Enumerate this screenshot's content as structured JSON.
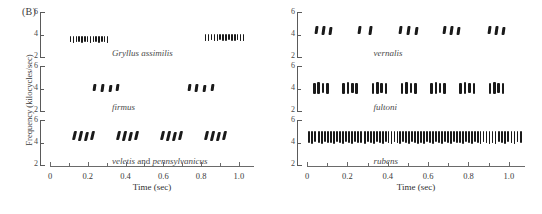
{
  "figure": {
    "panel_label": "(B)",
    "y_axis_title": "Frequency (kilocycles/sec)",
    "x_axis_title": "Time (sec)"
  },
  "axes": {
    "y_ticks": [
      "6",
      "4",
      "2"
    ],
    "y_range": [
      1.4,
      6.6
    ],
    "x_ticks_major": [
      "0",
      "0.2",
      "0.4",
      "0.6",
      "0.8",
      "1.0"
    ],
    "x_range": [
      0,
      1.08
    ],
    "x_minor_step": 0.1
  },
  "chart_data": {
    "type": "scatter",
    "title": "(B)",
    "xlabel": "Time (sec)",
    "ylabel": "Frequency (kilocycles/sec)",
    "xlim": [
      0,
      1.08
    ],
    "ylim": [
      1.4,
      6.6
    ],
    "grid": false,
    "legend": "none",
    "panels": [
      {
        "column": "left",
        "row": 0,
        "species_label": "Gryllus assimilis",
        "species_italic": "Gryllus assimilis",
        "dominant_frequency": 3.4,
        "pattern": "long chirps of many closely spaced pulses",
        "chirps": [
          {
            "start": 0.105,
            "end": 0.3,
            "pulses": 14,
            "freq": 3.4,
            "band": 0.75
          },
          {
            "start": 0.82,
            "end": 1.02,
            "pulses": 14,
            "freq": 3.6,
            "band": 0.75
          }
        ]
      },
      {
        "column": "left",
        "row": 1,
        "species_label": "firmus",
        "species_italic": "firmus",
        "dominant_frequency": 4.0,
        "pattern": "short chirps of 4 pulses",
        "chirps": [
          {
            "start": 0.23,
            "end": 0.35,
            "pulses": 4,
            "freq": 4.0,
            "band": 0.85
          },
          {
            "start": 0.73,
            "end": 0.85,
            "pulses": 4,
            "freq": 4.0,
            "band": 0.85
          }
        ]
      },
      {
        "column": "left",
        "row": 2,
        "species_label": "veletis and pennsylvanicus",
        "species_italic": "veletis",
        "species_conjunction": " and ",
        "species_italic2": "pennsylvanicus",
        "dominant_frequency": 4.7,
        "pattern": "regular chirps of 4 slanted pulses",
        "chirps": [
          {
            "start": 0.12,
            "end": 0.215,
            "pulses": 4,
            "freq": 4.7,
            "band": 1.1
          },
          {
            "start": 0.355,
            "end": 0.45,
            "pulses": 4,
            "freq": 4.7,
            "band": 1.1
          },
          {
            "start": 0.59,
            "end": 0.685,
            "pulses": 4,
            "freq": 4.7,
            "band": 1.1
          },
          {
            "start": 0.82,
            "end": 0.915,
            "pulses": 4,
            "freq": 4.7,
            "band": 1.1
          }
        ]
      },
      {
        "column": "right",
        "row": 0,
        "species_label": "vernalis",
        "species_italic": "vernalis",
        "dominant_frequency": 4.4,
        "pattern": "chirps of 2-3 pulses",
        "chirps": [
          {
            "start": 0.04,
            "end": 0.11,
            "pulses": 3,
            "freq": 4.4,
            "band": 1.0
          },
          {
            "start": 0.255,
            "end": 0.305,
            "pulses": 2,
            "freq": 4.4,
            "band": 1.0
          },
          {
            "start": 0.455,
            "end": 0.535,
            "pulses": 3,
            "freq": 4.4,
            "band": 1.0
          },
          {
            "start": 0.675,
            "end": 0.745,
            "pulses": 3,
            "freq": 4.4,
            "band": 1.0
          },
          {
            "start": 0.895,
            "end": 0.965,
            "pulses": 3,
            "freq": 4.4,
            "band": 1.0
          }
        ]
      },
      {
        "column": "right",
        "row": 1,
        "species_label": "fultoni",
        "species_italic": "fultoni",
        "dominant_frequency": 4.0,
        "pattern": "evenly spaced chirps of 3-4 pulses",
        "chirps": [
          {
            "start": 0.03,
            "end": 0.095,
            "pulses": 4,
            "freq": 4.0,
            "band": 1.3
          },
          {
            "start": 0.175,
            "end": 0.24,
            "pulses": 4,
            "freq": 4.0,
            "band": 1.3
          },
          {
            "start": 0.32,
            "end": 0.385,
            "pulses": 4,
            "freq": 4.0,
            "band": 1.3
          },
          {
            "start": 0.465,
            "end": 0.53,
            "pulses": 4,
            "freq": 4.0,
            "band": 1.3
          },
          {
            "start": 0.61,
            "end": 0.675,
            "pulses": 4,
            "freq": 4.0,
            "band": 1.3
          },
          {
            "start": 0.755,
            "end": 0.82,
            "pulses": 4,
            "freq": 4.0,
            "band": 1.3
          },
          {
            "start": 0.9,
            "end": 0.965,
            "pulses": 4,
            "freq": 4.0,
            "band": 1.3
          }
        ]
      },
      {
        "column": "right",
        "row": 2,
        "species_label": "rubens",
        "species_italic": "rubens",
        "dominant_frequency": 4.6,
        "pattern": "continuous trill of uniform pulses",
        "chirps": [
          {
            "start": 0.005,
            "end": 0.1,
            "pulses": 7,
            "freq": 4.6,
            "band": 1.4
          },
          {
            "start": 0.115,
            "end": 0.25,
            "pulses": 10,
            "freq": 4.6,
            "band": 1.4
          },
          {
            "start": 0.265,
            "end": 0.385,
            "pulses": 9,
            "freq": 4.6,
            "band": 1.4
          },
          {
            "start": 0.4,
            "end": 0.545,
            "pulses": 11,
            "freq": 4.6,
            "band": 1.4
          },
          {
            "start": 0.56,
            "end": 0.74,
            "pulses": 13,
            "freq": 4.6,
            "band": 1.4
          },
          {
            "start": 0.755,
            "end": 0.9,
            "pulses": 11,
            "freq": 4.6,
            "band": 1.4
          },
          {
            "start": 0.915,
            "end": 1.055,
            "pulses": 10,
            "freq": 4.6,
            "band": 1.4
          }
        ]
      }
    ]
  }
}
